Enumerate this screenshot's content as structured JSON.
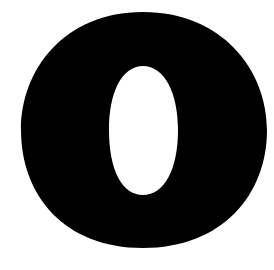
{
  "glyph": {
    "character": "O",
    "description": "Large bold black letter O on white background",
    "fill_color": "#000000",
    "background_color": "#ffffff"
  }
}
